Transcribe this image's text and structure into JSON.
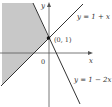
{
  "diagram": {
    "axes": {
      "x_label": "x",
      "y_label": "y",
      "origin_label": "0"
    },
    "point": {
      "label": "(0, 1)",
      "x": 0,
      "y": 1
    },
    "lines": [
      {
        "equation": "y = 1 + x",
        "slope": 1,
        "intercept": 1
      },
      {
        "equation": "y = 1 − 2x",
        "slope": -2,
        "intercept": 1
      }
    ],
    "shaded_region": {
      "description": "region above y = 1 + x and left of y = 1 − 2x",
      "color": "#c8c8c8"
    },
    "colors": {
      "axis": "#555555",
      "line": "#333333",
      "shade": "#c8c8c8"
    }
  }
}
